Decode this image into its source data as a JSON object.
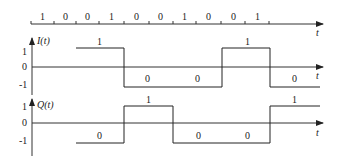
{
  "diagram": {
    "bit_axis": {
      "label": "t",
      "bits": [
        "1",
        "0",
        "0",
        "1",
        "0",
        "0",
        "1",
        "0",
        "0",
        "1"
      ]
    },
    "i_channel": {
      "label": "I(t)",
      "y_ticks": [
        "1",
        "0",
        "-1"
      ],
      "t_label": "t",
      "segment_labels": [
        "1",
        "0",
        "0",
        "1",
        "0"
      ]
    },
    "q_channel": {
      "label": "Q(t)",
      "y_ticks": [
        "1",
        "0",
        "-1"
      ],
      "t_label": "t",
      "segment_labels": [
        "0",
        "1",
        "0",
        "0",
        "1"
      ]
    }
  }
}
